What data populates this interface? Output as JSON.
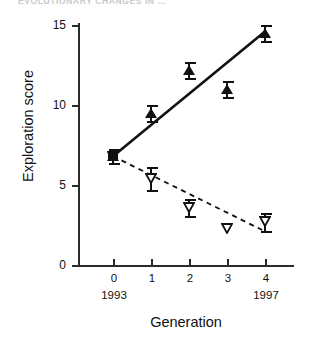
{
  "page": {
    "header_text": "EVOLUTIONARY CHANGES IN ..."
  },
  "chart_data": {
    "type": "scatter",
    "title": "",
    "subtitle": "",
    "xlabel": "Generation",
    "ylabel": "Exploration score",
    "x": [
      0,
      1,
      2,
      3,
      4
    ],
    "xticklabels": [
      "0",
      "1",
      "2",
      "3",
      "4"
    ],
    "x_secondary_labels": [
      {
        "x": 0,
        "label": "1993"
      },
      {
        "x": 4,
        "label": "1997"
      }
    ],
    "yticklabels": [
      "0",
      "5",
      "10",
      "15"
    ],
    "yticks": [
      0,
      5,
      10,
      15
    ],
    "ylim": [
      0,
      15
    ],
    "xlim": [
      -0.45,
      4.9
    ],
    "grid": false,
    "legend": "none",
    "series": [
      {
        "name": "high exploration line (filled triangles, solid fit)",
        "marker": "filled-triangle-up",
        "line": "solid",
        "values": [
          6.8,
          9.5,
          12.2,
          11.0,
          14.5
        ],
        "errors": [
          0.45,
          0.5,
          0.5,
          0.5,
          0.5
        ],
        "fit_endpoints": [
          {
            "x": 0,
            "y": 6.8
          },
          {
            "x": 4,
            "y": 14.6
          }
        ]
      },
      {
        "name": "low exploration line (open triangles, dashed fit)",
        "marker": "open-triangle-down",
        "line": "dashed",
        "values": [
          6.8,
          5.4,
          3.6,
          2.3,
          2.7
        ],
        "errors": [
          0.45,
          0.7,
          0.55,
          0.0,
          0.55
        ],
        "fit_endpoints": [
          {
            "x": 0,
            "y": 6.8
          },
          {
            "x": 4,
            "y": 2.1
          }
        ]
      }
    ],
    "colors": {
      "ink": "#111111",
      "axis": "#2b2b2b",
      "background": "#ffffff"
    }
  }
}
